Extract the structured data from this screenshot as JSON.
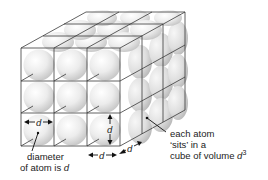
{
  "diagram": {
    "grid": {
      "cols": 3,
      "rows": 3,
      "depth": 3
    },
    "labels": {
      "front_width_symbol": "d",
      "front_height_symbol": "d",
      "bottom_width_symbol": "d",
      "depth_symbol": "d",
      "diameter_line1": "diameter",
      "diameter_line2": "of atom is ",
      "diameter_symbol": "d",
      "atom_line1": "each atom",
      "atom_line2": "‘sits’ in a",
      "atom_line3": "cube of volume ",
      "atom_symbol": "d",
      "atom_exponent": "3"
    },
    "colors": {
      "edge": "#3a3a3a",
      "sphere_light": "#ffffff",
      "sphere_dark": "#c8c8c8",
      "text": "#222222"
    }
  }
}
